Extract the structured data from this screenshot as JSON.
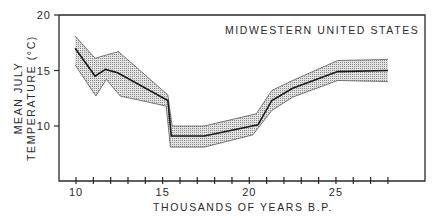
{
  "chart_data": {
    "type": "line",
    "title": "MIDWESTERN UNITED STATES",
    "xlabel": "THOUSANDS OF YEARS B.P.",
    "ylabel": "MEAN JULY TEMPERATURE (°C)",
    "ylabel_lines": [
      "MEAN JULY",
      "TEMPERATURE (°C)"
    ],
    "xlim": [
      9,
      29.5
    ],
    "ylim": [
      5,
      20
    ],
    "x_ticks": [
      10,
      11,
      12,
      13,
      14,
      15,
      16,
      17,
      18,
      19,
      20,
      21,
      22,
      23,
      24,
      25,
      26,
      27,
      28
    ],
    "x_tick_labels": [
      "10",
      "15",
      "20",
      "25"
    ],
    "x_tick_label_values": [
      10,
      15,
      20,
      25
    ],
    "y_ticks": [
      10,
      15,
      20
    ],
    "y_tick_labels": [
      "10",
      "15",
      "20"
    ],
    "grid": false,
    "legend": null,
    "series": [
      {
        "name": "Mean",
        "style": "solid-line",
        "x": [
          9.95,
          11.1,
          11.7,
          12.4,
          15.3,
          15.5,
          17.4,
          20.5,
          21.3,
          22.5,
          25.1,
          28.0
        ],
        "values": [
          17.0,
          14.5,
          15.1,
          14.8,
          12.3,
          9.1,
          9.1,
          10.1,
          12.3,
          13.4,
          14.9,
          15.0
        ]
      },
      {
        "name": "Upper bound",
        "style": "band-edge",
        "x": [
          9.95,
          11.1,
          11.75,
          12.45,
          15.3,
          15.55,
          17.4,
          20.4,
          21.3,
          22.5,
          25.1,
          28.0
        ],
        "values": [
          18.1,
          16.1,
          16.4,
          16.7,
          12.8,
          10.0,
          10.0,
          11.1,
          13.2,
          14.1,
          15.9,
          16.0
        ]
      },
      {
        "name": "Lower bound",
        "style": "band-edge",
        "x": [
          9.95,
          11.15,
          11.75,
          12.55,
          15.2,
          15.45,
          17.4,
          20.2,
          21.3,
          22.5,
          25.1,
          28.0
        ],
        "values": [
          15.5,
          12.7,
          14.2,
          12.7,
          11.8,
          8.1,
          8.1,
          9.2,
          11.4,
          12.6,
          14.1,
          14.0
        ]
      }
    ],
    "fill": "stippled grey band between upper and lower bound",
    "colors": {
      "line": "#1a1a1a",
      "axis": "#2a2a2a",
      "band_fill": "#c8c8c8",
      "background": "#ffffff"
    }
  }
}
